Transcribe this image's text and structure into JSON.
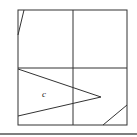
{
  "figure": {
    "width": 137,
    "height": 137,
    "stroke_color": "#333333",
    "frame": {
      "x": 18,
      "y": 10,
      "width": 109,
      "height": 115
    },
    "grid": {
      "vertical_x": 73,
      "horizontal_y": 68
    },
    "segments": [
      {
        "name": "top-left-slant",
        "x1": 24,
        "y1": 10,
        "x2": 18,
        "y2": 35
      },
      {
        "name": "triangle-upper-edge",
        "x1": 18,
        "y1": 69,
        "x2": 101,
        "y2": 97
      },
      {
        "name": "triangle-lower-edge",
        "x1": 18,
        "y1": 116,
        "x2": 101,
        "y2": 97
      },
      {
        "name": "bottom-right-slant",
        "x1": 103,
        "y1": 125,
        "x2": 127,
        "y2": 105
      }
    ],
    "labels": [
      {
        "name": "region-label-c",
        "text": "c",
        "x": 42,
        "y": 97
      }
    ],
    "separator": {
      "y": 134,
      "x1": 0,
      "x2": 137,
      "color": "#555555"
    }
  }
}
